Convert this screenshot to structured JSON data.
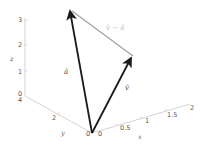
{
  "diagram": {
    "type": "3d-vector-plot",
    "colors": {
      "axis": "#c8c8c8",
      "vector": "#1a1a1a",
      "difference": "#a0a0a0",
      "tick_text": "#555555",
      "diff_label": "#bbbbbb"
    },
    "axes": {
      "x": {
        "label": "x",
        "ticks": [
          "0",
          "0.5",
          "1",
          "1.5",
          "2"
        ]
      },
      "y": {
        "label": "y",
        "ticks": [
          "0",
          "2",
          "4"
        ]
      },
      "z": {
        "label": "z",
        "ticks": [
          "0",
          "1",
          "2",
          "3"
        ]
      }
    },
    "vectors": [
      {
        "name": "a",
        "label": "ā",
        "color": "#1a1a1a"
      },
      {
        "name": "v",
        "label": "v̄",
        "color": "#1a1a1a"
      },
      {
        "name": "v_minus_a",
        "label": "v̄ − ā",
        "color": "#a0a0a0"
      }
    ]
  }
}
